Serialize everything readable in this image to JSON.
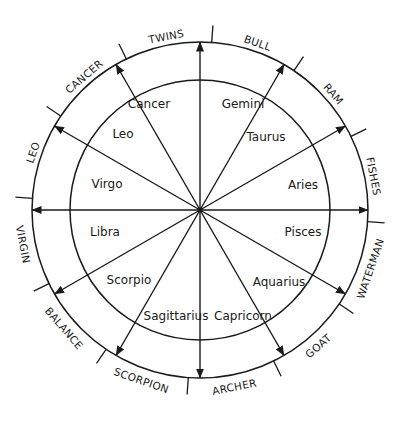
{
  "diagram": {
    "center": [
      200,
      210
    ],
    "outer_radius": 168,
    "inner_radius": 130,
    "stroke_color": "#1a1a1a",
    "background": "#ffffff",
    "tick_offset_deg": 4,
    "arrow_angles_deg": [
      -90,
      -60,
      -30,
      0,
      30,
      60,
      90,
      120,
      150,
      180,
      210,
      240
    ],
    "inner_signs": [
      {
        "name": "Cancer",
        "x": 149,
        "y": 108
      },
      {
        "name": "Gemini",
        "x": 243,
        "y": 108
      },
      {
        "name": "Leo",
        "x": 123,
        "y": 138
      },
      {
        "name": "Taurus",
        "x": 266,
        "y": 141
      },
      {
        "name": "Virgo",
        "x": 107,
        "y": 188
      },
      {
        "name": "Aries",
        "x": 303,
        "y": 189
      },
      {
        "name": "Libra",
        "x": 105,
        "y": 236
      },
      {
        "name": "Pisces",
        "x": 303,
        "y": 236
      },
      {
        "name": "Scorpio",
        "x": 129,
        "y": 284
      },
      {
        "name": "Aquarius",
        "x": 279,
        "y": 286
      },
      {
        "name": "Sagittarius",
        "x": 176,
        "y": 320
      },
      {
        "name": "Capricorn",
        "x": 243,
        "y": 320
      }
    ],
    "outer_constellations": [
      {
        "name": "TWINS",
        "angle": -101
      },
      {
        "name": "BULL",
        "angle": -71
      },
      {
        "name": "RAM",
        "angle": -41
      },
      {
        "name": "FISHES",
        "angle": -11
      },
      {
        "name": "WATERMAN",
        "angle": 19
      },
      {
        "name": "GOAT",
        "angle": 49
      },
      {
        "name": "ARCHER",
        "angle": 79
      },
      {
        "name": "SCORPION",
        "angle": 109
      },
      {
        "name": "BALANCE",
        "angle": 139
      },
      {
        "name": "VIRGIN",
        "angle": 169
      },
      {
        "name": "LEO",
        "angle": 199
      },
      {
        "name": "CANCER",
        "angle": 229
      }
    ]
  }
}
